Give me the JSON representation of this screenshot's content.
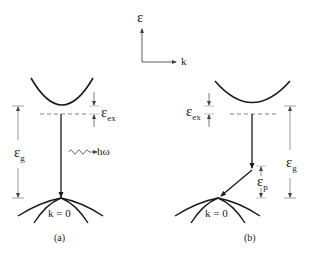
{
  "axes": {
    "y_label": "ε",
    "x_label": "k"
  },
  "panel_a": {
    "caption": "(a)",
    "gap_label": "ε",
    "gap_sub": "g",
    "exciton_label": "ε",
    "exciton_sub": "ex",
    "photon_label": "hω",
    "k_label": "k  = 0",
    "transition": "direct"
  },
  "panel_b": {
    "caption": "(b)",
    "gap_label": "ε",
    "gap_sub": "g",
    "exciton_label": "ε",
    "exciton_sub": "ex",
    "phonon_label": "ε",
    "phonon_sub": "p",
    "k_label": "k  = 0",
    "transition": "indirect"
  },
  "colors": {
    "line": "#1a1a1a",
    "dim_line": "#555555",
    "dashed": "#777777"
  }
}
